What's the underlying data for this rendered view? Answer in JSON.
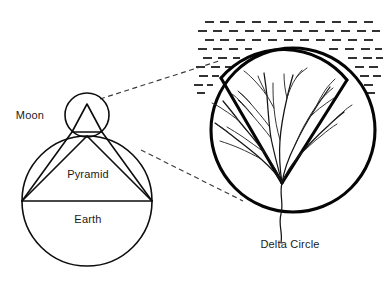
{
  "figure": {
    "background_color": "#ffffff",
    "line_color": "#111111",
    "label_color": "#1a1a1a",
    "width": 388,
    "height": 285
  },
  "labels": {
    "moon": "Moon",
    "pyramid": "Pyramid",
    "earth": "Earth",
    "delta_circle": "Delta Circle"
  },
  "left_diagram": {
    "name": "earth-moon-pyramid-construction",
    "earth_circle": {
      "cx": 87,
      "cy": 201,
      "r": 65
    },
    "moon_circle": {
      "cx": 87,
      "cy": 115,
      "r": 22
    },
    "pyramid_triangle": {
      "apex": {
        "x": 87,
        "y": 136
      },
      "base_left": {
        "x": 22,
        "y": 201
      },
      "base_right": {
        "x": 152,
        "y": 201
      },
      "base_is_earth_diameter": true
    },
    "moon_inner_triangle": {
      "apex": {
        "x": 87,
        "y": 104
      },
      "base_left": {
        "x": 72,
        "y": 132
      },
      "base_right": {
        "x": 102,
        "y": 132
      }
    },
    "equator_line": {
      "x1": 22,
      "y1": 201,
      "x2": 152,
      "y2": 201
    }
  },
  "right_diagram": {
    "name": "delta-circle",
    "circle": {
      "cx": 293,
      "cy": 130,
      "r": 82
    },
    "delta_wedge": {
      "apex": {
        "x": 282,
        "y": 183
      },
      "left_vertex": {
        "x": 221,
        "y": 78
      },
      "right_vertex": {
        "x": 347,
        "y": 80
      },
      "description": "fan-shaped river delta wedge with distributary channels"
    },
    "main_river": {
      "description": "river channel running from wedge apex down past circle bottom to the label"
    },
    "water_hatching": {
      "description": "sea surface rendered as staggered rows of short horizontal dashes",
      "rows": 9
    }
  },
  "connectors": [
    {
      "name": "upper-magnifier-connector",
      "style": "dashed",
      "from": {
        "x": 100,
        "y": 99
      },
      "to": {
        "x": 219,
        "y": 61
      }
    },
    {
      "name": "lower-magnifier-connector",
      "style": "dashed",
      "from": {
        "x": 141,
        "y": 150
      },
      "to": {
        "x": 239,
        "y": 199
      }
    }
  ],
  "label_positions": {
    "moon": {
      "x": 30,
      "y": 118
    },
    "pyramid": {
      "x": 62,
      "y": 177
    },
    "earth": {
      "x": 68,
      "y": 222
    },
    "delta_circle": {
      "x": 248,
      "y": 244
    }
  }
}
